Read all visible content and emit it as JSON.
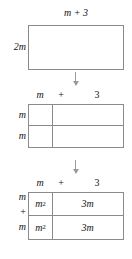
{
  "figure": {
    "panels": [
      {
        "id": "panel-1",
        "type": "single-rectangle",
        "top_label": "m + 3",
        "left_label": "2m"
      },
      {
        "id": "panel-2",
        "type": "empty-grid-2x2",
        "column_header": {
          "term1": "m",
          "operator": "+",
          "term2": "3"
        },
        "row_labels": [
          "m",
          "m"
        ],
        "cells": [
          [
            "",
            ""
          ],
          [
            "",
            ""
          ]
        ]
      },
      {
        "id": "panel-3",
        "type": "filled-grid-2x2",
        "column_header": {
          "term1": "m",
          "operator": "+",
          "term2": "3"
        },
        "row_labels": [
          "m",
          "+",
          "m"
        ],
        "cells": [
          [
            {
              "base": "m",
              "exponent": "2"
            },
            {
              "text": "3m"
            }
          ],
          [
            {
              "base": "m",
              "exponent": "2"
            },
            {
              "text": "3m"
            }
          ]
        ]
      }
    ],
    "arrows": [
      {
        "id": "arrow-1",
        "direction": "down",
        "from": "panel-1",
        "to": "panel-2"
      },
      {
        "id": "arrow-2",
        "direction": "down",
        "from": "panel-2",
        "to": "panel-3"
      }
    ]
  },
  "colors": {
    "border": "#8a8a8a",
    "text": "#111111",
    "arrow": "#9a9a9a",
    "background": "#ffffff"
  }
}
